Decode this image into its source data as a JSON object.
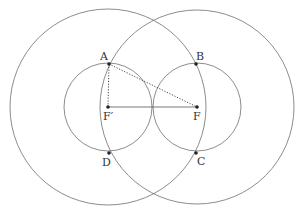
{
  "diagram": {
    "type": "geometry-construction",
    "labels": {
      "A": "A",
      "B": "B",
      "C": "C",
      "D": "D",
      "F": "F",
      "Fp": "F′"
    },
    "points": {
      "A": [
        109,
        64
      ],
      "B": [
        196,
        64
      ],
      "C": [
        196,
        153
      ],
      "D": [
        109,
        153
      ],
      "F": [
        197,
        107
      ],
      "Fp": [
        108,
        107
      ]
    },
    "circles": [
      {
        "name": "large-circle-left",
        "center": "Fp",
        "r": 98
      },
      {
        "name": "large-circle-right",
        "center": "F",
        "r": 97
      },
      {
        "name": "small-circle-left",
        "center": "Fp",
        "r": 44
      },
      {
        "name": "small-circle-right",
        "center": "F",
        "r": 44
      }
    ],
    "segments": [
      {
        "from": "Fp",
        "to": "F",
        "style": "solid"
      },
      {
        "from": "A",
        "to": "Fp",
        "style": "dotted"
      },
      {
        "from": "A",
        "to": "F",
        "style": "dotted"
      }
    ],
    "colors": {
      "stroke": "#6e6e6e",
      "point": "#222222",
      "label": "#333333",
      "background": "#ffffff"
    }
  }
}
